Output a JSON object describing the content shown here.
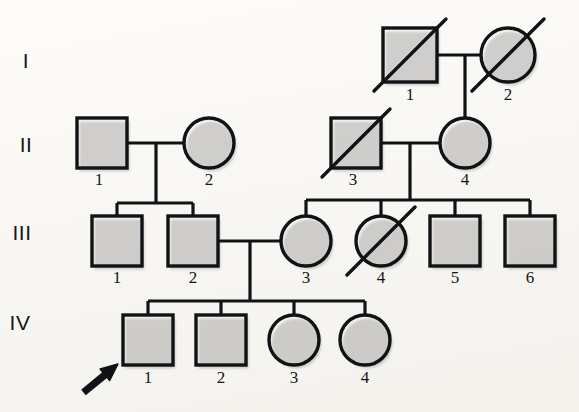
{
  "figure": {
    "kind": "pedigree-chart",
    "background_color": "#fbfaf7",
    "line_color": "#111216",
    "affected_fill": "#4a5d85",
    "unaffected_fill": "#ffffff"
  },
  "legend_semantics": {
    "square": "male",
    "circle": "female",
    "filled": "affected",
    "open": "unaffected",
    "slash": "deceased",
    "arrow": "proband"
  },
  "generations": [
    {
      "label": "I",
      "label_x": 26,
      "label_y": 68,
      "individuals": [
        {
          "id": "1",
          "sex": "male",
          "shape": "square",
          "affected": true,
          "deceased": true,
          "proband": false,
          "cx": 410,
          "cy": 55,
          "size": 54,
          "id_x": 410,
          "id_y": 100
        },
        {
          "id": "2",
          "sex": "female",
          "shape": "circle",
          "affected": false,
          "deceased": true,
          "proband": false,
          "cx": 508,
          "cy": 55,
          "size": 54,
          "id_x": 508,
          "id_y": 100
        }
      ]
    },
    {
      "label": "II",
      "label_x": 26,
      "label_y": 152,
      "individuals": [
        {
          "id": "1",
          "sex": "male",
          "shape": "square",
          "affected": false,
          "deceased": false,
          "proband": false,
          "cx": 102,
          "cy": 143,
          "size": 50,
          "id_x": 99,
          "id_y": 185
        },
        {
          "id": "2",
          "sex": "female",
          "shape": "circle",
          "affected": false,
          "deceased": false,
          "proband": false,
          "cx": 209,
          "cy": 143,
          "size": 50,
          "id_x": 209,
          "id_y": 185
        },
        {
          "id": "3",
          "sex": "male",
          "shape": "square",
          "affected": false,
          "deceased": true,
          "proband": false,
          "cx": 356,
          "cy": 143,
          "size": 50,
          "id_x": 353,
          "id_y": 185
        },
        {
          "id": "4",
          "sex": "female",
          "shape": "circle",
          "affected": false,
          "deceased": false,
          "proband": false,
          "cx": 465,
          "cy": 143,
          "size": 50,
          "id_x": 465,
          "id_y": 185
        }
      ]
    },
    {
      "label": "III",
      "label_x": 22,
      "label_y": 240,
      "individuals": [
        {
          "id": "1",
          "sex": "male",
          "shape": "square",
          "affected": false,
          "deceased": false,
          "proband": false,
          "cx": 117,
          "cy": 241,
          "size": 50,
          "id_x": 117,
          "id_y": 283
        },
        {
          "id": "2",
          "sex": "male",
          "shape": "square",
          "affected": false,
          "deceased": false,
          "proband": false,
          "cx": 193,
          "cy": 241,
          "size": 50,
          "id_x": 193,
          "id_y": 283
        },
        {
          "id": "3",
          "sex": "female",
          "shape": "circle",
          "affected": false,
          "deceased": false,
          "proband": false,
          "cx": 306,
          "cy": 241,
          "size": 50,
          "id_x": 306,
          "id_y": 283
        },
        {
          "id": "4",
          "sex": "female",
          "shape": "circle",
          "affected": false,
          "deceased": true,
          "proband": false,
          "cx": 381,
          "cy": 241,
          "size": 50,
          "id_x": 381,
          "id_y": 283
        },
        {
          "id": "5",
          "sex": "male",
          "shape": "square",
          "affected": true,
          "deceased": false,
          "proband": false,
          "cx": 455,
          "cy": 241,
          "size": 50,
          "id_x": 455,
          "id_y": 283
        },
        {
          "id": "6",
          "sex": "male",
          "shape": "square",
          "affected": false,
          "deceased": false,
          "proband": false,
          "cx": 530,
          "cy": 241,
          "size": 50,
          "id_x": 530,
          "id_y": 283
        }
      ]
    },
    {
      "label": "IV",
      "label_x": 20,
      "label_y": 330,
      "individuals": [
        {
          "id": "1",
          "sex": "male",
          "shape": "square",
          "affected": false,
          "deceased": false,
          "proband": true,
          "cx": 148,
          "cy": 340,
          "size": 50,
          "id_x": 148,
          "id_y": 383
        },
        {
          "id": "2",
          "sex": "male",
          "shape": "square",
          "affected": true,
          "deceased": false,
          "proband": false,
          "cx": 221,
          "cy": 340,
          "size": 50,
          "id_x": 221,
          "id_y": 383
        },
        {
          "id": "3",
          "sex": "female",
          "shape": "circle",
          "affected": false,
          "deceased": false,
          "proband": false,
          "cx": 294,
          "cy": 340,
          "size": 50,
          "id_x": 294,
          "id_y": 383
        },
        {
          "id": "4",
          "sex": "female",
          "shape": "circle",
          "affected": false,
          "deceased": false,
          "proband": false,
          "cx": 365,
          "cy": 340,
          "size": 50,
          "id_x": 365,
          "id_y": 383
        }
      ]
    }
  ],
  "matings": [
    {
      "name": "I-1 x I-2",
      "x1": 437,
      "x2": 481,
      "y": 55,
      "drop_x": 465,
      "drop_y2": 118
    },
    {
      "name": "II-1 x II-2",
      "x1": 127,
      "x2": 184,
      "y": 143,
      "drop_x": 156,
      "drop_y2": 203
    },
    {
      "name": "II-3 x II-4",
      "x1": 381,
      "x2": 440,
      "y": 143,
      "drop_x": 410,
      "drop_y2": 200
    },
    {
      "name": "III-2 x III-3",
      "x1": 218,
      "x2": 281,
      "y": 241,
      "drop_x": 250,
      "drop_y2": 301
    }
  ],
  "sibships": [
    {
      "name": "sibship-III-1-2",
      "y": 203,
      "x1": 117,
      "x2": 193,
      "stubs": [
        117,
        193
      ],
      "stub_y2": 216
    },
    {
      "name": "sibship-III-3-6",
      "y": 200,
      "x1": 306,
      "x2": 530,
      "stubs": [
        306,
        381,
        455,
        530
      ],
      "stub_y2": 216
    },
    {
      "name": "sibship-IV-1-4",
      "y": 301,
      "x1": 148,
      "x2": 365,
      "stubs": [
        148,
        221,
        294,
        365
      ],
      "stub_y2": 315
    }
  ],
  "proband_arrow": {
    "name": "proband-arrow",
    "tip_x": 118,
    "tip_y": 364,
    "tail_x": 84,
    "tail_y": 392
  }
}
